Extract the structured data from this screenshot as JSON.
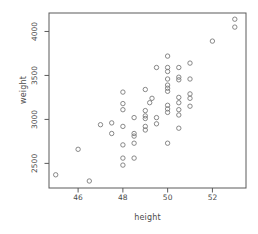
{
  "figure": {
    "background": "#ffffff",
    "box_color": "#5a5a5a",
    "tick_color": "#5a5a5a",
    "text_color": "#4a4a4a",
    "point_color": "#7a7a7a"
  },
  "chart_data": {
    "type": "scatter",
    "title": "",
    "xlabel": "height",
    "ylabel": "weight",
    "marker": "open-circle",
    "grid": false,
    "legend": null,
    "xlim": [
      44.7,
      53.5
    ],
    "ylim": [
      2220,
      4210
    ],
    "x_ticks": [
      46,
      48,
      50,
      52
    ],
    "y_ticks": [
      2500,
      3000,
      3500,
      4000
    ],
    "points": [
      [
        45,
        2370
      ],
      [
        46,
        2660
      ],
      [
        46.5,
        2300
      ],
      [
        47,
        2940
      ],
      [
        47.5,
        2960
      ],
      [
        47.5,
        2840
      ],
      [
        48,
        3310
      ],
      [
        48,
        3180
      ],
      [
        48,
        3110
      ],
      [
        48,
        2920
      ],
      [
        48,
        2710
      ],
      [
        48,
        2560
      ],
      [
        48,
        2480
      ],
      [
        48.5,
        3020
      ],
      [
        48.5,
        2840
      ],
      [
        48.5,
        2810
      ],
      [
        48.5,
        2730
      ],
      [
        48.5,
        2560
      ],
      [
        49,
        3340
      ],
      [
        49,
        3100
      ],
      [
        49,
        3040
      ],
      [
        49,
        3010
      ],
      [
        49,
        2920
      ],
      [
        49,
        2880
      ],
      [
        49.2,
        3190
      ],
      [
        49.3,
        3240
      ],
      [
        49.5,
        3590
      ],
      [
        49.5,
        3020
      ],
      [
        49.5,
        2950
      ],
      [
        50,
        3720
      ],
      [
        50,
        3590
      ],
      [
        50,
        3545
      ],
      [
        50,
        3460
      ],
      [
        50,
        3390
      ],
      [
        50,
        3355
      ],
      [
        50,
        3320
      ],
      [
        50,
        3160
      ],
      [
        50,
        3120
      ],
      [
        50,
        3080
      ],
      [
        50,
        2730
      ],
      [
        50.5,
        3590
      ],
      [
        50.5,
        3480
      ],
      [
        50.5,
        3450
      ],
      [
        50.5,
        3250
      ],
      [
        50.5,
        3190
      ],
      [
        50.5,
        3110
      ],
      [
        50.5,
        3050
      ],
      [
        50.5,
        2900
      ],
      [
        51,
        3640
      ],
      [
        51,
        3460
      ],
      [
        51,
        3290
      ],
      [
        51,
        3240
      ],
      [
        51,
        3150
      ],
      [
        52,
        3890
      ],
      [
        53,
        4140
      ],
      [
        53,
        4050
      ]
    ]
  }
}
